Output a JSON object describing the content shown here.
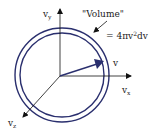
{
  "diagram": {
    "axes": {
      "vx": {
        "label": "v",
        "subscript": "x"
      },
      "vy": {
        "label": "v",
        "subscript": "y"
      },
      "vz": {
        "label": "v",
        "subscript": "z"
      }
    },
    "vector_label": "v",
    "volume_label": "\"Volume\"",
    "volume_formula_prefix": "= 4πv",
    "volume_formula_exp": "2",
    "volume_formula_suffix": "dv",
    "colors": {
      "circle": "#2a2f6e",
      "vector": "#2a2f6e",
      "axes": "#111111",
      "text": "#222222"
    }
  }
}
